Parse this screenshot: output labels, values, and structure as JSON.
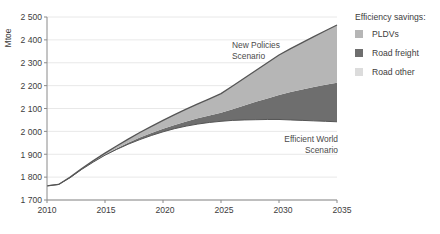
{
  "axis": {
    "ylabel": "Mtoe",
    "yticks": [
      "2 500",
      "2 400",
      "2 300",
      "2 200",
      "2 100",
      "2 000",
      "1 900",
      "1 800",
      "1 700"
    ],
    "xticks": [
      "2010",
      "2015",
      "2020",
      "2025",
      "2030",
      "2035"
    ]
  },
  "annotations": {
    "new_policies_line1": "New Policies",
    "new_policies_line2": "Scenario",
    "efficient_world_line1": "Efficient World",
    "efficient_world_line2": "Scenario"
  },
  "legend": {
    "title": "Efficiency savings:",
    "items": [
      {
        "label": "PLDVs",
        "color": "#b6b6b6"
      },
      {
        "label": "Road freight",
        "color": "#6e6e6e"
      },
      {
        "label": "Road other",
        "color": "#dcdcdc"
      }
    ]
  },
  "colors": {
    "pldvs": "#b6b6b6",
    "road_freight": "#6e6e6e",
    "road_other": "#dcdcdc",
    "line": "#555555",
    "grid": "#e2e2e2",
    "axis": "#8a8a8a",
    "text": "#3d3d3d"
  },
  "chart_data": {
    "type": "area",
    "title": "",
    "subtitle": "",
    "xlabel": "",
    "ylabel": "Mtoe",
    "xlim": [
      2010,
      2035
    ],
    "ylim": [
      1700,
      2500
    ],
    "grid": true,
    "legend_position": "right",
    "legend_title": "Efficiency savings:",
    "x": [
      2010,
      2011,
      2012,
      2013,
      2014,
      2015,
      2016,
      2017,
      2018,
      2019,
      2020,
      2021,
      2022,
      2023,
      2024,
      2025,
      2026,
      2027,
      2028,
      2029,
      2030,
      2031,
      2032,
      2033,
      2034,
      2035
    ],
    "series": [
      {
        "name": "New Policies Scenario",
        "type": "line",
        "values": [
          1762,
          1768,
          1800,
          1838,
          1872,
          1905,
          1936,
          1966,
          1995,
          2022,
          2048,
          2073,
          2097,
          2120,
          2142,
          2165,
          2198,
          2232,
          2266,
          2300,
          2334,
          2362,
          2388,
          2414,
          2440,
          2465
        ]
      },
      {
        "name": "Efficient World Scenario",
        "type": "line",
        "values": [
          1762,
          1768,
          1798,
          1834,
          1866,
          1896,
          1921,
          1944,
          1964,
          1982,
          1998,
          2012,
          2023,
          2032,
          2039,
          2044,
          2048,
          2050,
          2051,
          2052,
          2052,
          2050,
          2048,
          2046,
          2044,
          2042
        ]
      },
      {
        "name": "PLDVs",
        "type": "band",
        "values": [
          0,
          0,
          1,
          2,
          4,
          7,
          11,
          16,
          22,
          29,
          37,
          45,
          54,
          63,
          73,
          84,
          101,
          119,
          137,
          156,
          175,
          190,
          205,
          220,
          236,
          252
        ]
      },
      {
        "name": "Road freight",
        "type": "band",
        "values": [
          0,
          0,
          1,
          2,
          2,
          2,
          4,
          6,
          9,
          11,
          13,
          16,
          20,
          25,
          30,
          37,
          49,
          63,
          78,
          92,
          107,
          122,
          135,
          148,
          160,
          171
        ]
      },
      {
        "name": "Road other",
        "type": "band",
        "values": [
          0,
          0,
          0,
          0,
          0,
          0,
          0,
          0,
          0,
          0,
          0,
          0,
          0,
          0,
          0,
          0,
          0,
          0,
          0,
          0,
          0,
          0,
          0,
          0,
          0,
          0
        ]
      }
    ]
  }
}
